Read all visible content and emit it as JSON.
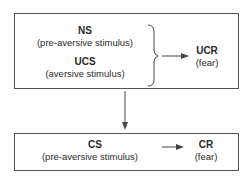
{
  "top_box": {
    "ns": {
      "label": "NS",
      "description": "(pre-aversive stimulus)"
    },
    "ucs": {
      "label": "UCS",
      "description": "(aversive stimulus)"
    },
    "ucr": {
      "label": "UCR",
      "description": "(fear)"
    }
  },
  "bottom_box": {
    "cs": {
      "label": "CS",
      "description": "(pre-aversive stimulus)"
    },
    "cr": {
      "label": "CR",
      "description": "(fear)"
    }
  },
  "colors": {
    "line": "#444444",
    "text": "#2a2a2a",
    "border": "#555555"
  }
}
